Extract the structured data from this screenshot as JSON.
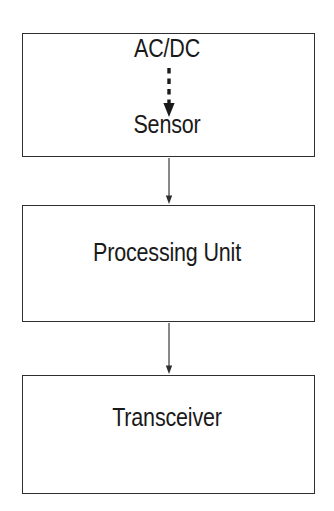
{
  "diagram": {
    "background_color": "#ffffff",
    "stroke_color": "#2e2e2e",
    "text_color": "#1a1a1a",
    "nodes": [
      {
        "id": "sensor-block",
        "labels": [
          "AC/DC",
          "Sensor"
        ],
        "acdc_label": "AC/DC",
        "sensor_label": "Sensor"
      },
      {
        "id": "processing-block",
        "label": "Processing Unit"
      },
      {
        "id": "transceiver-block",
        "label": "Transceiver"
      }
    ],
    "connectors": [
      {
        "id": "power-to-sensor",
        "from": "AC/DC",
        "to": "Sensor",
        "style": "dashed",
        "arrowhead": "filled-triangle"
      },
      {
        "id": "sensor-to-processing",
        "from": "Sensor",
        "to": "Processing Unit",
        "style": "solid",
        "arrowhead": "filled-triangle"
      },
      {
        "id": "processing-to-transceiver",
        "from": "Processing Unit",
        "to": "Transceiver",
        "style": "solid",
        "arrowhead": "filled-triangle"
      }
    ]
  }
}
